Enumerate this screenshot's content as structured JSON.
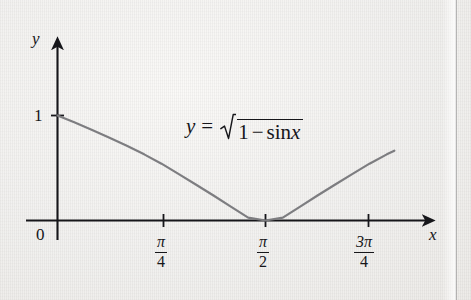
{
  "figure": {
    "kind": "math-graph",
    "background_color": "#f1f0ee",
    "axis_color": "#16161a",
    "curve_color": "#7d7d80"
  },
  "axes": {
    "x_label": "x",
    "y_label": "y",
    "origin_label": "0",
    "y_tick_label": "1"
  },
  "x_ticks": [
    {
      "numerator": "π",
      "denominator": "4"
    },
    {
      "numerator": "π",
      "denominator": "2"
    },
    {
      "numerator": "3π",
      "denominator": "4"
    }
  ],
  "equation": {
    "lhs": "y",
    "relation": "=",
    "radicand_first": "1",
    "radicand_op": "−",
    "radicand_fn": "sin",
    "radicand_arg": "x",
    "plain": "y = √(1 − sin x)"
  },
  "chart_data": {
    "type": "line",
    "title": "",
    "subtitle": "",
    "xlabel": "x",
    "ylabel": "y",
    "function": "y = sqrt(1 - sin(x))",
    "grid": false,
    "legend": null,
    "xlim": [
      0,
      2.6
    ],
    "ylim": [
      0,
      1.35
    ],
    "x_tick_values": [
      0,
      0.7853981634,
      1.5707963268,
      2.3561944902
    ],
    "x_tick_labels": [
      "0",
      "π/4",
      "π/2",
      "3π/4"
    ],
    "y_tick_values": [
      1
    ],
    "y_tick_labels": [
      "1"
    ],
    "annotations": [
      {
        "text": "y = √(1 − sin x)",
        "x": 1.05,
        "y": 0.93
      }
    ],
    "series": [
      {
        "name": "y = sqrt(1 - sin x)",
        "color": "#7d7d80",
        "x": [
          0.0,
          0.1309,
          0.2618,
          0.3927,
          0.5236,
          0.6545,
          0.7854,
          0.9163,
          1.0472,
          1.1781,
          1.309,
          1.4399,
          1.5708,
          1.7017,
          1.8326,
          1.9635,
          2.0944,
          2.2253,
          2.3562,
          2.4871,
          2.544
        ],
        "y": [
          1.0,
          0.9327,
          0.8624,
          0.7889,
          0.7117,
          0.63,
          0.5412,
          0.4413,
          0.3407,
          0.2377,
          0.1325,
          0.0272,
          0.0,
          0.0272,
          0.1325,
          0.2377,
          0.3407,
          0.4413,
          0.5412,
          0.63,
          0.6645
        ]
      }
    ]
  }
}
